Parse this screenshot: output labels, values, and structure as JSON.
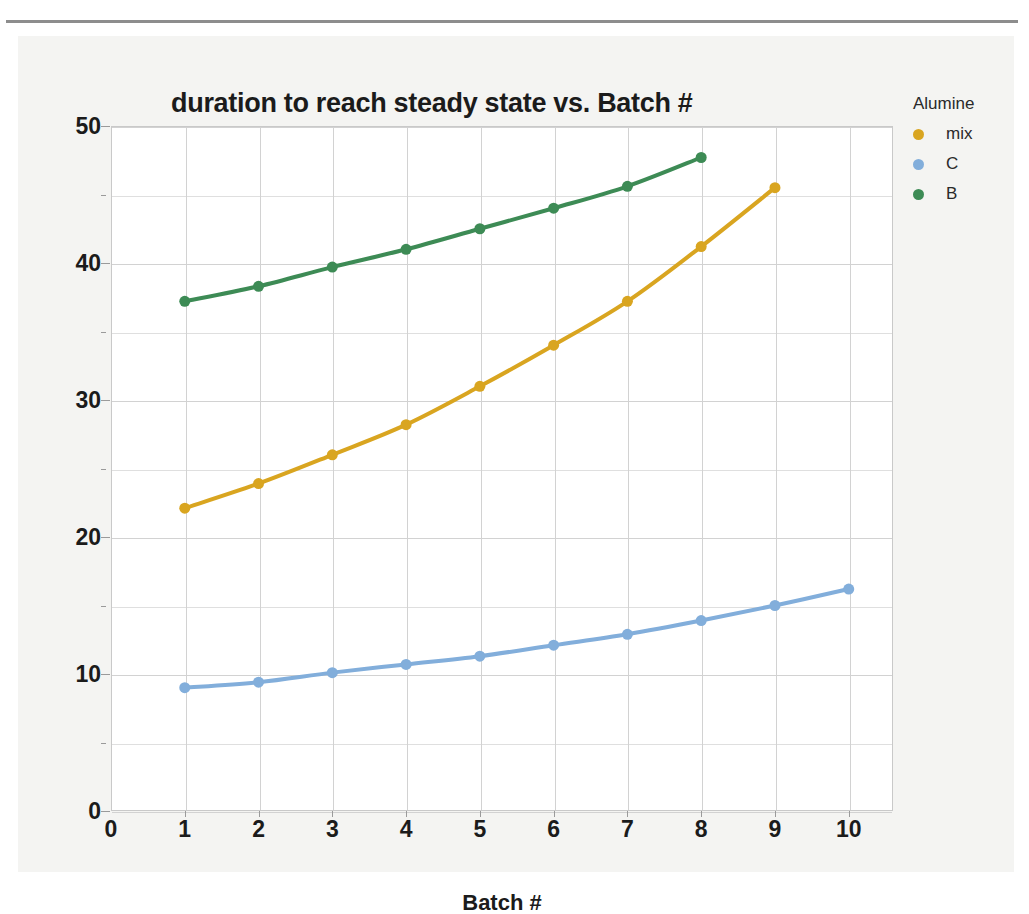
{
  "chart_data": {
    "type": "line",
    "title": "duration to reach steady state vs. Batch #",
    "xlabel": "Batch #",
    "ylabel": "duration to reach steady state (min)",
    "xlim": [
      0,
      10.6
    ],
    "ylim": [
      0,
      50
    ],
    "xticks": [
      "0",
      "1",
      "2",
      "3",
      "4",
      "5",
      "6",
      "7",
      "8",
      "9",
      "10"
    ],
    "yticks": [
      "0",
      "10",
      "20",
      "30",
      "40",
      "50"
    ],
    "y_minor_step": 5,
    "grid": true,
    "legend_position": "right",
    "legend_title": "Alumine",
    "markers": true,
    "series": [
      {
        "name": "mix",
        "color": "#d9a520",
        "x": [
          1,
          2,
          3,
          4,
          5,
          6,
          7,
          8,
          9
        ],
        "values": [
          22.1,
          23.9,
          26.0,
          28.2,
          31.0,
          34.0,
          37.2,
          41.2,
          45.5
        ]
      },
      {
        "name": "C",
        "color": "#82aedb",
        "x": [
          1,
          2,
          3,
          4,
          5,
          6,
          7,
          8,
          9,
          10
        ],
        "values": [
          9.0,
          9.4,
          10.1,
          10.7,
          11.3,
          12.1,
          12.9,
          13.9,
          15.0,
          16.2
        ]
      },
      {
        "name": "B",
        "color": "#3d8b55",
        "x": [
          1,
          2,
          3,
          4,
          5,
          6,
          7,
          8
        ],
        "values": [
          37.2,
          38.3,
          39.7,
          41.0,
          42.5,
          44.0,
          45.6,
          47.7
        ]
      }
    ]
  },
  "legend": {
    "title": "Alumine",
    "items": [
      {
        "label": "mix",
        "color": "#d9a520"
      },
      {
        "label": "C",
        "color": "#82aedb"
      },
      {
        "label": "B",
        "color": "#3d8b55"
      }
    ]
  }
}
